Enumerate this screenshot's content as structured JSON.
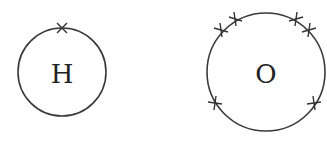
{
  "diagram": {
    "type": "electron-shell-diagram",
    "atoms": [
      {
        "symbol": "H",
        "center": [
          62,
          72
        ],
        "radius": 44,
        "electrons": [
          {
            "x": 62,
            "y": 28
          }
        ]
      },
      {
        "symbol": "O",
        "center": [
          266,
          72
        ],
        "radius": 59,
        "electrons": [
          {
            "x": 235,
            "y": 19
          },
          {
            "x": 221,
            "y": 30
          },
          {
            "x": 296,
            "y": 19
          },
          {
            "x": 309,
            "y": 30
          },
          {
            "x": 215,
            "y": 103
          },
          {
            "x": 314,
            "y": 103
          }
        ]
      }
    ],
    "electron_marker": "cross",
    "colors": {
      "line": "#3a3a3a",
      "text": "#222222",
      "background": "#ffffff"
    }
  }
}
